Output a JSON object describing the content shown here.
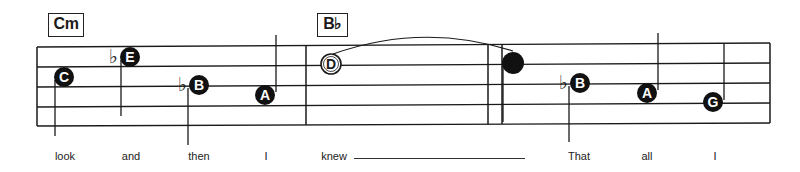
{
  "chords": [
    {
      "label": "Cm",
      "x": 48,
      "y": 13,
      "w": 34,
      "h": 22
    },
    {
      "label": "B♭",
      "x": 317,
      "y": 13,
      "w": 29,
      "h": 22
    }
  ],
  "staff": {
    "lines_left_y": [
      47,
      67,
      87,
      107,
      126
    ],
    "lines_right_y": [
      43,
      63,
      83,
      103,
      123
    ],
    "x_start": 37,
    "x_end": 770,
    "barlines_x": [
      37,
      306,
      488,
      770
    ],
    "extra_barline_x": 502,
    "color": "#1a1a1a"
  },
  "notes": [
    {
      "letter": "C",
      "x": 64,
      "y": 77,
      "style": "filled",
      "accidental": "",
      "stem": "down",
      "stem_x": 55,
      "stem_from": 80,
      "stem_to": 136
    },
    {
      "letter": "E",
      "x": 130,
      "y": 57,
      "style": "filled",
      "accidental": "♭",
      "stem": "down",
      "stem_x": 121,
      "stem_from": 60,
      "stem_to": 116
    },
    {
      "letter": "B",
      "x": 199,
      "y": 85,
      "style": "filled",
      "accidental": "♭",
      "stem": "down",
      "stem_x": 188,
      "stem_from": 88,
      "stem_to": 145
    },
    {
      "letter": "A",
      "x": 265,
      "y": 95,
      "style": "filled",
      "accidental": "",
      "stem": "up",
      "stem_x": 276,
      "stem_from": 92,
      "stem_to": 35
    },
    {
      "letter": "D",
      "x": 331,
      "y": 64,
      "style": "open",
      "accidental": "",
      "stem": "none"
    },
    {
      "letter": "",
      "x": 513,
      "y": 63,
      "style": "filled",
      "accidental": "",
      "stem": "down",
      "stem_x": 503,
      "stem_from": 66,
      "stem_to": 122
    },
    {
      "letter": "B",
      "x": 580,
      "y": 83,
      "style": "filled",
      "accidental": "♭",
      "stem": "down",
      "stem_x": 569,
      "stem_from": 86,
      "stem_to": 142
    },
    {
      "letter": "A",
      "x": 647,
      "y": 93,
      "style": "filled",
      "accidental": "",
      "stem": "up",
      "stem_x": 658,
      "stem_from": 90,
      "stem_to": 33
    },
    {
      "letter": "G",
      "x": 713,
      "y": 102,
      "style": "filled",
      "accidental": "",
      "stem": "up",
      "stem_x": 724,
      "stem_from": 100,
      "stem_to": 43
    }
  ],
  "tie": {
    "from_x": 333,
    "from_y": 54,
    "to_x": 513,
    "to_y": 51,
    "peak_y": 34
  },
  "lyrics": [
    {
      "text": "look",
      "x": 65
    },
    {
      "text": "and",
      "x": 131
    },
    {
      "text": "then",
      "x": 199
    },
    {
      "text": "I",
      "x": 266
    },
    {
      "text": "knew",
      "x": 334
    },
    {
      "text": "That",
      "x": 579
    },
    {
      "text": "all",
      "x": 647
    },
    {
      "text": "I",
      "x": 715
    }
  ],
  "melisma_line": {
    "x1": 354,
    "x2": 525,
    "y": 158
  }
}
